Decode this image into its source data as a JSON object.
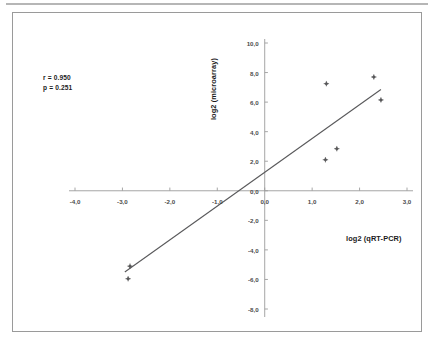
{
  "chart_data": {
    "type": "scatter",
    "title": "",
    "xlabel": "log2 (qRT-PCR)",
    "ylabel": "log2 (microarray)",
    "xlim": [
      -4.0,
      3.0
    ],
    "ylim": [
      -8.0,
      10.0
    ],
    "xticks": [
      -4.0,
      -3.0,
      -2.0,
      -1.0,
      0.0,
      1.0,
      2.0,
      3.0
    ],
    "xtick_labels": [
      "-4,0",
      "-3,0",
      "-2,0",
      "-1,0",
      "0,0",
      "1,0",
      "2,0",
      "3,0"
    ],
    "yticks": [
      -8.0,
      -6.0,
      -4.0,
      -2.0,
      0.0,
      2.0,
      4.0,
      6.0,
      8.0,
      10.0
    ],
    "ytick_labels": [
      "-8,0",
      "-6,0",
      "-4,0",
      "-2,0",
      "0,0",
      "2,0",
      "4,0",
      "6,0",
      "8,0",
      "10,0"
    ],
    "grid": false,
    "legend": false,
    "axes_cross_at_origin": true,
    "marker_color": "#59595b",
    "line_color": "#59595b",
    "points": [
      {
        "x": -2.88,
        "y": -5.95
      },
      {
        "x": -2.84,
        "y": -5.1
      },
      {
        "x": 1.28,
        "y": 2.1
      },
      {
        "x": 1.3,
        "y": 7.25
      },
      {
        "x": 1.52,
        "y": 2.85
      },
      {
        "x": 2.3,
        "y": 7.7
      },
      {
        "x": 2.45,
        "y": 6.15
      }
    ],
    "trendline": {
      "x0": -2.95,
      "y0": -5.5,
      "x1": 2.45,
      "y1": 6.85
    },
    "annotations": {
      "r_label": "r = 0.950",
      "p_label": "p = 0.251",
      "r_value": 0.95,
      "p_value": 0.251
    }
  }
}
